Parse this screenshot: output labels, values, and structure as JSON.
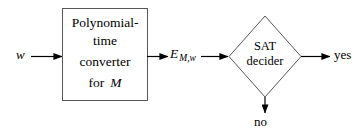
{
  "figure": {
    "type": "flow-diagram",
    "background_color": "#ffffff",
    "stroke_color": "#000000"
  },
  "nodes": {
    "converter": {
      "shape": "rectangle",
      "lines": [
        "Polynomial-",
        "time",
        "converter",
        "for"
      ],
      "machine_symbol": "M"
    },
    "decider": {
      "shape": "diamond",
      "lines": [
        "SAT",
        "decider"
      ]
    }
  },
  "edges": {
    "input": {
      "label": "w",
      "style": "italic",
      "direction": "right"
    },
    "formula": {
      "base": "E",
      "subscript": "M,w",
      "style": "italic",
      "direction": "right"
    },
    "accept": {
      "label": "yes",
      "direction": "right"
    },
    "reject": {
      "label": "no",
      "direction": "down"
    }
  }
}
